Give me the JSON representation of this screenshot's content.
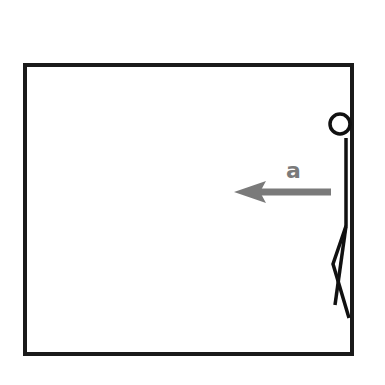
{
  "diagram": {
    "type": "physics-free-body-sketch",
    "box": {
      "x": 25,
      "y": 65,
      "width": 327,
      "height": 289,
      "stroke": "#1a1a1a",
      "stroke_width": 4
    },
    "acceleration_arrow": {
      "label": "a",
      "direction": "left",
      "color": "#7a7a7a",
      "tail": [
        331,
        192
      ],
      "tip": [
        234,
        192
      ]
    },
    "figure": {
      "description": "stick figure pressed against right wall",
      "color": "#111111",
      "head": {
        "cx": 340,
        "cy": 124,
        "r": 10
      }
    }
  }
}
